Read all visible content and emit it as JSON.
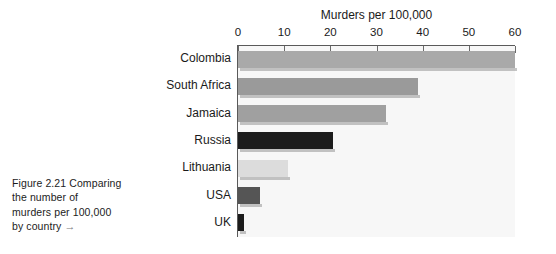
{
  "figure": {
    "caption_lines": [
      "Figure 2.21  Comparing",
      "the number of",
      "murders per 100,000",
      "by country"
    ],
    "caption_arrow": "→"
  },
  "chart_data": {
    "type": "bar",
    "orientation": "horizontal",
    "title": "",
    "xlabel": "Murders per 100,000",
    "ylabel": "",
    "categories": [
      "Colombia",
      "South Africa",
      "Jamaica",
      "Russia",
      "Lithuania",
      "USA",
      "UK"
    ],
    "values": [
      60,
      39,
      32,
      20.5,
      10.8,
      4.8,
      1.4
    ],
    "bar_colors": [
      "#a9a9a9",
      "#9a9a9a",
      "#a0a0a0",
      "#1c1c1c",
      "#dcdcdc",
      "#555555",
      "#1c1c1c"
    ],
    "xlim": [
      0,
      60
    ],
    "xticks": [
      0,
      10,
      20,
      30,
      40,
      50,
      60
    ],
    "xtick_labels": [
      "0",
      "10",
      "20",
      "30",
      "40",
      "50",
      "60"
    ],
    "grid": false,
    "legend": "none",
    "axis_position": "top",
    "plot_background": "#f7f7f7"
  }
}
